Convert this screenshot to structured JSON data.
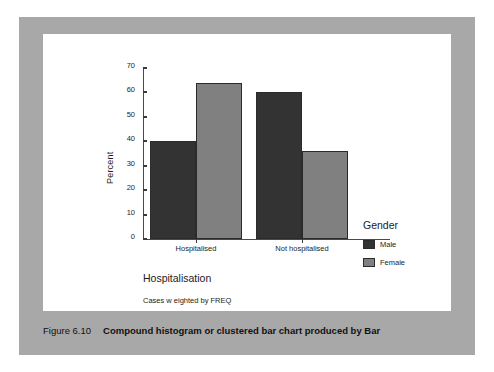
{
  "caption": {
    "number": "Figure 6.10",
    "text": "Compound histogram or clustered bar chart produced by Bar"
  },
  "chart": {
    "y_axis_title": "Percent",
    "x_axis_title": "Hospitalisation",
    "footnote": "Cases w eighted by FREQ",
    "legend_title": "Gender"
  },
  "colors": {
    "male": "#333333",
    "female": "#808080",
    "panel": "#a8a8a8",
    "card": "#ffffff",
    "axis": "#4a4a4a"
  },
  "chart_data": {
    "type": "bar",
    "title": "",
    "xlabel": "Hospitalisation",
    "ylabel": "Percent",
    "categories": [
      "Hospitalised",
      "Not hospitalised"
    ],
    "series": [
      {
        "name": "Male",
        "values": [
          40,
          60
        ]
      },
      {
        "name": "Female",
        "values": [
          64,
          36
        ]
      }
    ],
    "ylim": [
      0,
      70
    ],
    "yticks": [
      0,
      10,
      20,
      30,
      40,
      50,
      60,
      70
    ],
    "ytick_labels": [
      "0",
      "10",
      "20",
      "30",
      "40",
      "50",
      "60",
      "70"
    ],
    "grid": false,
    "legend_position": "right",
    "annotations": [
      "Cases w eighted by FREQ"
    ]
  }
}
